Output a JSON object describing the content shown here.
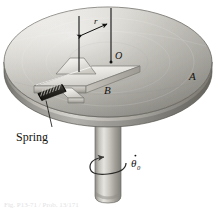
{
  "figure": {
    "caption": "Fig. P13-71 / Prob. 13/171",
    "background_color": "#ffffff",
    "labels": {
      "disk": "A",
      "slider": "B",
      "center": "O",
      "radius": "r",
      "spring": "Spring",
      "angular_rate": "θ",
      "angular_rate_subscript": "0",
      "angular_rate_full": "θ̅0"
    },
    "colors": {
      "disk_top_light": "#e7e5e0",
      "disk_top_mid": "#bfbdb6",
      "disk_top_dark": "#8e8c86",
      "disk_rim": "#a3a19a",
      "disk_rim_dark": "#7d7b75",
      "shaft_light": "#e3e1dc",
      "shaft_mid": "#b4b2ab",
      "shaft_dark": "#7e7c76",
      "slider_light": "#f2f0eb",
      "slider_mid": "#cfcdc6",
      "slider_dark": "#9a9891",
      "spring_dark": "#2e2c28",
      "line": "#111111",
      "outline": "#6e6c66"
    },
    "geometry": {
      "disk_center_x": 108,
      "disk_center_y": 62,
      "disk_rx": 104,
      "disk_ry": 55,
      "disk_thickness": 16,
      "shaft_width": 26,
      "shaft_top_y": 118,
      "shaft_bottom_y": 200
    },
    "elements": [
      {
        "name": "disk",
        "label": "A",
        "type": "rotating-platform"
      },
      {
        "name": "slider",
        "label": "B",
        "type": "sliding-block"
      },
      {
        "name": "center-point",
        "label": "O",
        "type": "reference-point"
      },
      {
        "name": "radius-dimension",
        "label": "r",
        "type": "dimension"
      },
      {
        "name": "spring",
        "label": "Spring",
        "type": "coil-spring"
      },
      {
        "name": "shaft",
        "label": "",
        "type": "vertical-shaft"
      },
      {
        "name": "rotation-arrow",
        "label": "θ̅0",
        "type": "angular-velocity"
      }
    ]
  }
}
